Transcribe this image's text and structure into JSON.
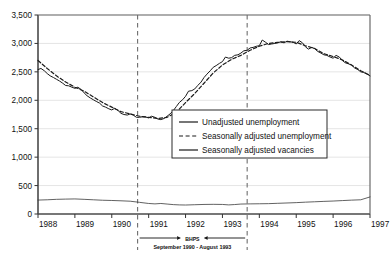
{
  "chart_data": {
    "type": "line",
    "title": "",
    "xlabel": "",
    "ylabel": "",
    "ylim": [
      0,
      3500
    ],
    "xlim": [
      1988,
      1997
    ],
    "grid": true,
    "legend_position": "center-right",
    "ytick_labels": [
      "0",
      "500",
      "1,000",
      "1,500",
      "2,000",
      "2,500",
      "3,000",
      "3,500"
    ],
    "ytick_values": [
      0,
      500,
      1000,
      1500,
      2000,
      2500,
      3000,
      3500
    ],
    "xtick_labels": [
      "1988",
      "1989",
      "1990",
      "1991",
      "1992",
      "1993",
      "1994",
      "1995",
      "1996",
      "1997"
    ],
    "xtick_values": [
      1988,
      1989,
      1990,
      1991,
      1992,
      1993,
      1994,
      1995,
      1996,
      1997
    ],
    "series": [
      {
        "name": "Unadjusted unemployment",
        "style": "solid",
        "color": "#1a1a1a",
        "width": 1.0,
        "points": [
          [
            1988.0,
            2540
          ],
          [
            1988.08,
            2560
          ],
          [
            1988.17,
            2520
          ],
          [
            1988.25,
            2470
          ],
          [
            1988.33,
            2430
          ],
          [
            1988.42,
            2400
          ],
          [
            1988.5,
            2370
          ],
          [
            1988.58,
            2340
          ],
          [
            1988.67,
            2300
          ],
          [
            1988.75,
            2260
          ],
          [
            1988.83,
            2255
          ],
          [
            1988.92,
            2230
          ],
          [
            1989.0,
            2210
          ],
          [
            1989.08,
            2230
          ],
          [
            1989.17,
            2190
          ],
          [
            1989.25,
            2130
          ],
          [
            1989.33,
            2080
          ],
          [
            1989.42,
            2040
          ],
          [
            1989.5,
            2010
          ],
          [
            1989.58,
            1980
          ],
          [
            1989.67,
            1950
          ],
          [
            1989.75,
            1900
          ],
          [
            1989.83,
            1880
          ],
          [
            1989.92,
            1850
          ],
          [
            1990.0,
            1830
          ],
          [
            1990.08,
            1860
          ],
          [
            1990.17,
            1820
          ],
          [
            1990.25,
            1770
          ],
          [
            1990.33,
            1750
          ],
          [
            1990.42,
            1740
          ],
          [
            1990.5,
            1760
          ],
          [
            1990.58,
            1740
          ],
          [
            1990.67,
            1700
          ],
          [
            1990.75,
            1700
          ],
          [
            1990.83,
            1710
          ],
          [
            1990.92,
            1705
          ],
          [
            1991.0,
            1690
          ],
          [
            1991.08,
            1720
          ],
          [
            1991.17,
            1700
          ],
          [
            1991.25,
            1670
          ],
          [
            1991.33,
            1660
          ],
          [
            1991.42,
            1680
          ],
          [
            1991.5,
            1720
          ],
          [
            1991.58,
            1760
          ],
          [
            1991.67,
            1820
          ],
          [
            1991.75,
            1890
          ],
          [
            1991.83,
            1960
          ],
          [
            1991.92,
            2010
          ],
          [
            1992.0,
            2070
          ],
          [
            1992.08,
            2160
          ],
          [
            1992.17,
            2170
          ],
          [
            1992.25,
            2200
          ],
          [
            1992.33,
            2260
          ],
          [
            1992.42,
            2320
          ],
          [
            1992.5,
            2400
          ],
          [
            1992.58,
            2460
          ],
          [
            1992.67,
            2520
          ],
          [
            1992.75,
            2580
          ],
          [
            1992.83,
            2610
          ],
          [
            1992.92,
            2650
          ],
          [
            1993.0,
            2680
          ],
          [
            1993.08,
            2760
          ],
          [
            1993.17,
            2740
          ],
          [
            1993.25,
            2750
          ],
          [
            1993.33,
            2790
          ],
          [
            1993.42,
            2800
          ],
          [
            1993.5,
            2830
          ],
          [
            1993.58,
            2870
          ],
          [
            1993.67,
            2880
          ],
          [
            1993.75,
            2920
          ],
          [
            1993.83,
            2930
          ],
          [
            1993.92,
            2950
          ],
          [
            1994.0,
            2960
          ],
          [
            1994.08,
            3060
          ],
          [
            1994.17,
            3020
          ],
          [
            1994.25,
            2980
          ],
          [
            1994.33,
            2990
          ],
          [
            1994.42,
            3000
          ],
          [
            1994.5,
            3010
          ],
          [
            1994.58,
            3030
          ],
          [
            1994.67,
            3010
          ],
          [
            1994.75,
            3040
          ],
          [
            1994.83,
            3030
          ],
          [
            1994.92,
            3020
          ],
          [
            1995.0,
            2990
          ],
          [
            1995.08,
            3050
          ],
          [
            1995.17,
            3010
          ],
          [
            1995.25,
            2940
          ],
          [
            1995.33,
            2900
          ],
          [
            1995.42,
            2930
          ],
          [
            1995.5,
            2910
          ],
          [
            1995.58,
            2860
          ],
          [
            1995.67,
            2830
          ],
          [
            1995.75,
            2800
          ],
          [
            1995.83,
            2790
          ],
          [
            1995.92,
            2760
          ],
          [
            1996.0,
            2740
          ],
          [
            1996.08,
            2790
          ],
          [
            1996.17,
            2760
          ],
          [
            1996.25,
            2700
          ],
          [
            1996.33,
            2660
          ],
          [
            1996.42,
            2640
          ],
          [
            1996.5,
            2620
          ],
          [
            1996.58,
            2570
          ],
          [
            1996.67,
            2540
          ],
          [
            1996.75,
            2500
          ],
          [
            1996.83,
            2490
          ],
          [
            1996.92,
            2460
          ],
          [
            1997.0,
            2430
          ]
        ]
      },
      {
        "name": "Seasonally adjusted unemployment",
        "style": "dashed",
        "color": "#1a1a1a",
        "width": 1.2,
        "points": [
          [
            1988.0,
            2700
          ],
          [
            1988.25,
            2560
          ],
          [
            1988.5,
            2430
          ],
          [
            1988.75,
            2320
          ],
          [
            1989.0,
            2230
          ],
          [
            1989.25,
            2160
          ],
          [
            1989.5,
            2060
          ],
          [
            1989.75,
            1960
          ],
          [
            1990.0,
            1880
          ],
          [
            1990.25,
            1800
          ],
          [
            1990.5,
            1760
          ],
          [
            1990.75,
            1720
          ],
          [
            1991.0,
            1700
          ],
          [
            1991.25,
            1680
          ],
          [
            1991.5,
            1700
          ],
          [
            1991.75,
            1790
          ],
          [
            1992.0,
            1960
          ],
          [
            1992.25,
            2120
          ],
          [
            1992.5,
            2300
          ],
          [
            1992.75,
            2480
          ],
          [
            1993.0,
            2620
          ],
          [
            1993.25,
            2720
          ],
          [
            1993.5,
            2790
          ],
          [
            1993.75,
            2880
          ],
          [
            1994.0,
            2950
          ],
          [
            1994.25,
            3000
          ],
          [
            1994.5,
            3020
          ],
          [
            1994.75,
            3030
          ],
          [
            1995.0,
            3020
          ],
          [
            1995.25,
            2960
          ],
          [
            1995.5,
            2910
          ],
          [
            1995.75,
            2820
          ],
          [
            1996.0,
            2770
          ],
          [
            1996.25,
            2710
          ],
          [
            1996.5,
            2620
          ],
          [
            1996.75,
            2520
          ],
          [
            1997.0,
            2440
          ]
        ]
      },
      {
        "name": "Seasonally adjusted vacancies",
        "style": "solid",
        "color": "#3a3a3a",
        "width": 0.8,
        "points": [
          [
            1988.0,
            245
          ],
          [
            1988.25,
            250
          ],
          [
            1988.5,
            258
          ],
          [
            1988.75,
            262
          ],
          [
            1989.0,
            265
          ],
          [
            1989.25,
            258
          ],
          [
            1989.5,
            250
          ],
          [
            1989.75,
            242
          ],
          [
            1990.0,
            238
          ],
          [
            1990.25,
            232
          ],
          [
            1990.5,
            225
          ],
          [
            1990.75,
            205
          ],
          [
            1991.0,
            185
          ],
          [
            1991.17,
            178
          ],
          [
            1991.33,
            185
          ],
          [
            1991.5,
            175
          ],
          [
            1991.67,
            165
          ],
          [
            1991.83,
            160
          ],
          [
            1992.0,
            158
          ],
          [
            1992.25,
            163
          ],
          [
            1992.5,
            168
          ],
          [
            1992.75,
            170
          ],
          [
            1993.0,
            168
          ],
          [
            1993.17,
            160
          ],
          [
            1993.33,
            166
          ],
          [
            1993.5,
            175
          ],
          [
            1993.75,
            178
          ],
          [
            1994.0,
            180
          ],
          [
            1994.25,
            182
          ],
          [
            1994.5,
            188
          ],
          [
            1994.75,
            194
          ],
          [
            1995.0,
            200
          ],
          [
            1995.25,
            208
          ],
          [
            1995.5,
            215
          ],
          [
            1995.75,
            222
          ],
          [
            1996.0,
            228
          ],
          [
            1996.25,
            236
          ],
          [
            1996.5,
            244
          ],
          [
            1996.75,
            250
          ],
          [
            1997.0,
            300
          ]
        ]
      }
    ],
    "legend_entries": [
      {
        "label": "Unadjusted unemployment",
        "style": "solid"
      },
      {
        "label": "Seasonally adjusted unemployment",
        "style": "dashed"
      },
      {
        "label": "Seasonally adjusted vacancies",
        "style": "solid"
      }
    ],
    "annotations": {
      "bhps_label": "BHPS",
      "bhps_period": "September 1990 - August 1993",
      "marker_lines": [
        1990.7,
        1993.67
      ]
    }
  }
}
